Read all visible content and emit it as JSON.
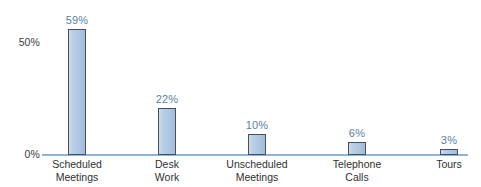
{
  "chart_data": {
    "type": "bar",
    "title": "",
    "subtitle": "",
    "xlabel": "",
    "ylabel": "",
    "ylim": [
      0,
      65
    ],
    "grid": false,
    "legend": false,
    "orientation": "vertical",
    "categories": [
      "Scheduled Meetings",
      "Desk Work",
      "Unscheduled Meetings",
      "Telephone Calls",
      "Tours"
    ],
    "category_lines": [
      [
        "Scheduled",
        "Meetings"
      ],
      [
        "Desk",
        "Work"
      ],
      [
        "Unscheduled",
        "Meetings"
      ],
      [
        "Telephone",
        "Calls"
      ],
      [
        "Tours",
        ""
      ]
    ],
    "values": [
      59,
      22,
      10,
      6,
      3
    ],
    "value_labels": [
      "59%",
      "22%",
      "10%",
      "6%",
      "3%"
    ],
    "y_ticks": [
      0,
      50
    ],
    "y_tick_labels": [
      "0%",
      "50%"
    ],
    "colors": {
      "bar_fill_light": "#cfdded",
      "bar_fill": "#b0c9e2",
      "bar_fill_dark": "#a2bdd9",
      "bar_border": "#44505d",
      "axis_line": "#8fb4d9",
      "value_label": "#5b7fa6",
      "tick_label": "#3a3a3a",
      "category_label": "#2f2f2f",
      "background": "#ffffff"
    }
  },
  "axis": {
    "tick_50": "50%",
    "tick_0": "0%"
  }
}
